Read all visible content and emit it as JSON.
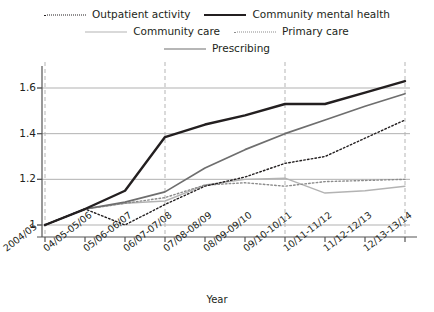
{
  "legend": {
    "rows": [
      [
        {
          "label": "Outpatient activity",
          "style": "dotted",
          "color": "#231f20",
          "width": 1.3,
          "name": "legend-item-outpatient-activity"
        },
        {
          "label": "Community mental health",
          "style": "solid",
          "color": "#231f20",
          "width": 2.4,
          "name": "legend-item-community-mental-health"
        }
      ],
      [
        {
          "label": "Community care",
          "style": "solid",
          "color": "#b3b3b3",
          "width": 1.4,
          "name": "legend-item-community-care"
        },
        {
          "label": "Primary care",
          "style": "dotted",
          "color": "#8c8c8c",
          "width": 1.3,
          "name": "legend-item-primary-care"
        }
      ],
      [
        {
          "label": "Prescribing",
          "style": "solid",
          "color": "#6e6e6e",
          "width": 1.6,
          "name": "legend-item-prescribing"
        }
      ]
    ]
  },
  "chart_data": {
    "type": "line",
    "title": "",
    "xlabel": "Year",
    "ylabel": "",
    "ylim": [
      0.95,
      1.68
    ],
    "yticks": [
      1,
      1.2,
      1.4,
      1.6
    ],
    "ytick_labels": [
      "1",
      "1.2",
      "1.4",
      "1.6"
    ],
    "grid": true,
    "grid_axis": "both",
    "vertical_gridline_categories": [
      "2004/05",
      "06/07-07/08",
      "09/10-10/11",
      "12/13-13/14"
    ],
    "legend_position": "top",
    "categories": [
      "2004/05",
      "04/05-05/06",
      "05/06-06/07",
      "06/07-07/08",
      "07/08-08/09",
      "08/09-09/10",
      "09/10-10/11",
      "10/11-11/12",
      "11/12-12/13",
      "12/13-13/14"
    ],
    "series": [
      {
        "name": "Outpatient activity",
        "style": "dotted",
        "color": "#231f20",
        "width": 1.4,
        "values": [
          1.0,
          1.07,
          1.0,
          1.09,
          1.17,
          1.21,
          1.27,
          1.3,
          1.38,
          1.46
        ]
      },
      {
        "name": "Community mental health",
        "style": "solid",
        "color": "#231f20",
        "width": 2.4,
        "values": [
          1.0,
          1.07,
          1.15,
          1.385,
          1.44,
          1.48,
          1.53,
          1.53,
          1.58,
          1.63
        ]
      },
      {
        "name": "Community care",
        "style": "solid",
        "color": "#b3b3b3",
        "width": 1.4,
        "values": [
          1.0,
          1.07,
          1.095,
          1.105,
          1.175,
          1.2,
          1.205,
          1.14,
          1.15,
          1.17
        ]
      },
      {
        "name": "Primary care",
        "style": "dotted",
        "color": "#8c8c8c",
        "width": 1.4,
        "values": [
          1.0,
          1.07,
          1.095,
          1.12,
          1.175,
          1.185,
          1.17,
          1.19,
          1.195,
          1.2
        ]
      },
      {
        "name": "Prescribing",
        "style": "solid",
        "color": "#6e6e6e",
        "width": 1.7,
        "values": [
          1.0,
          1.07,
          1.1,
          1.145,
          1.25,
          1.33,
          1.4,
          1.46,
          1.52,
          1.575
        ]
      }
    ]
  }
}
